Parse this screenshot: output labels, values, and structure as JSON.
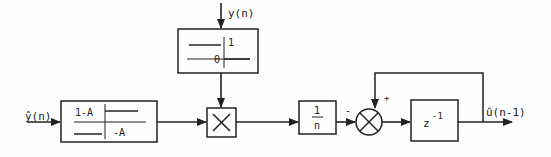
{
  "diagram": {
    "type": "block-diagram",
    "inputs": {
      "left_input": "ŷ(n)",
      "top_input": "y(n)"
    },
    "output": "û(n-1)",
    "blocks": {
      "quantizer_left": {
        "upper_label": "1-A",
        "lower_label": "-A"
      },
      "quantizer_top": {
        "upper_label": "1",
        "lower_label": "0"
      },
      "multiplier": {
        "symbol": "×"
      },
      "gain": {
        "numerator": "1",
        "denominator": "n"
      },
      "summer": {
        "minus_sign": "-",
        "plus_sign": "+"
      },
      "delay": {
        "base": "z",
        "exponent": "-1"
      }
    },
    "colors": {
      "line": "#222222",
      "background": "#fdfdfd"
    }
  }
}
